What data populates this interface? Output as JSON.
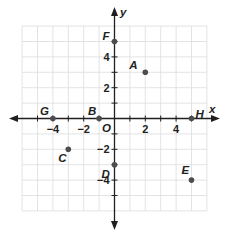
{
  "chart_data": {
    "type": "scatter",
    "title": "",
    "xlabel": "x",
    "ylabel": "y",
    "origin_label": "O",
    "xlim": [
      -6,
      6
    ],
    "ylim": [
      -6,
      6
    ],
    "grid": true,
    "x_ticks": [
      -4,
      -2,
      2,
      4
    ],
    "y_ticks": [
      4,
      2,
      -2,
      -4
    ],
    "x_tick_labels": [
      "−4",
      "−2",
      "2",
      "4"
    ],
    "y_tick_labels": [
      "4",
      "2",
      "−2",
      "−4"
    ],
    "points": [
      {
        "label": "A",
        "x": 2,
        "y": 3
      },
      {
        "label": "B",
        "x": -1,
        "y": 0
      },
      {
        "label": "C",
        "x": -3,
        "y": -2
      },
      {
        "label": "D",
        "x": 0,
        "y": -3
      },
      {
        "label": "E",
        "x": 5,
        "y": -4
      },
      {
        "label": "F",
        "x": 0,
        "y": 5
      },
      {
        "label": "G",
        "x": -4,
        "y": 0
      },
      {
        "label": "H",
        "x": 5,
        "y": 0
      }
    ],
    "colors": {
      "axis": "#231f20",
      "grid": "#dcdcdc",
      "point": "#4d4d4f"
    }
  }
}
